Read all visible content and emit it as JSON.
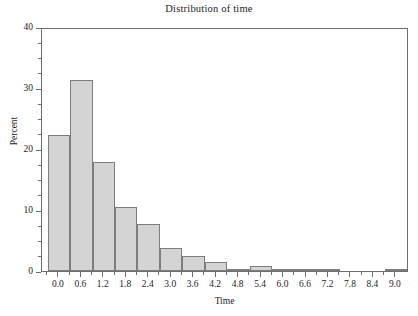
{
  "chart_data": {
    "type": "bar",
    "title": "Distribution of time",
    "xlabel": "Time",
    "ylabel": "Percent",
    "grid": false,
    "legend": null,
    "bin_width": 0.6,
    "bin_starts": [
      -0.3,
      0.3,
      0.9,
      1.5,
      2.1,
      2.7,
      3.3,
      3.9,
      4.5,
      5.1,
      5.7,
      6.3,
      6.9,
      7.5,
      8.1,
      8.7
    ],
    "bin_centers": [
      0.0,
      0.6,
      1.2,
      1.8,
      2.4,
      3.0,
      3.6,
      4.2,
      4.8,
      5.4,
      6.0,
      6.6,
      7.2,
      7.8,
      8.4,
      9.0
    ],
    "values": [
      22.3,
      31.3,
      17.8,
      10.5,
      7.7,
      3.8,
      2.4,
      1.5,
      0.15,
      0.9,
      0.35,
      0.25,
      0.05,
      0.0,
      0.0,
      0.05
    ],
    "xlim": [
      -0.45,
      9.35
    ],
    "ylim": [
      0,
      40
    ],
    "x_ticks": [
      0.0,
      0.6,
      1.2,
      1.8,
      2.4,
      3.0,
      3.6,
      4.2,
      4.8,
      5.4,
      6.0,
      6.6,
      7.2,
      7.8,
      8.4,
      9.0
    ],
    "x_tick_labels": [
      "0.0",
      "0.6",
      "1.2",
      "1.8",
      "2.4",
      "3.0",
      "3.6",
      "4.2",
      "4.8",
      "5.4",
      "6.0",
      "6.6",
      "7.2",
      "7.8",
      "8.4",
      "9.0"
    ],
    "y_ticks": [
      0,
      10,
      20,
      30,
      40
    ],
    "y_tick_labels": [
      "0",
      "10",
      "20",
      "30",
      "40"
    ],
    "y_minor_ticks": [
      2.5,
      5,
      7.5,
      12.5,
      15,
      17.5,
      22.5,
      25,
      27.5,
      32.5,
      35,
      37.5
    ],
    "colors": {
      "bar_fill": "#d4d4d4",
      "bar_stroke": "#7d7d7d",
      "axis": "#6e6e6e",
      "text": "#1d1d1d",
      "background": "#ffffff"
    }
  }
}
